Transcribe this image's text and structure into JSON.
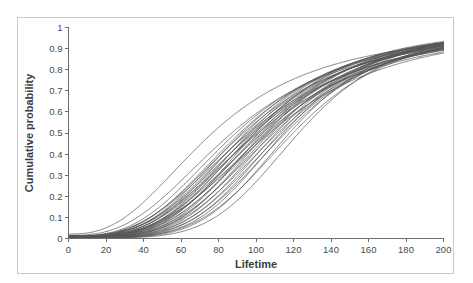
{
  "figure": {
    "background_color": "#ffffff",
    "frame_color": "#c8c8c8",
    "axis_color": "#6e6e6e",
    "curve_color": "#565656"
  },
  "chart_data": {
    "type": "line",
    "title": "",
    "subtitle": "",
    "xlabel": "Lifetime",
    "ylabel": "Cumulative probability",
    "xlim": [
      0,
      200
    ],
    "ylim": [
      0,
      1
    ],
    "grid": false,
    "legend": null,
    "legend_position": "none",
    "x_ticks": [
      0,
      20,
      40,
      60,
      80,
      100,
      120,
      140,
      160,
      180,
      200
    ],
    "x_tick_labels": [
      "0",
      "20",
      "40",
      "60",
      "80",
      "100",
      "120",
      "140",
      "160",
      "180",
      "200"
    ],
    "y_ticks": [
      0,
      0.1,
      0.2,
      0.3,
      0.4,
      0.5,
      0.6,
      0.7,
      0.8,
      0.9,
      1
    ],
    "y_tick_labels": [
      "0",
      "0.1",
      "0.2",
      "0.3",
      "0.4",
      "0.5",
      "0.6",
      "0.7",
      "0.8",
      "0.9",
      "1"
    ],
    "tick_direction": "out",
    "annotations": [],
    "x": [
      0,
      5,
      10,
      15,
      20,
      25,
      30,
      35,
      40,
      45,
      50,
      55,
      60,
      65,
      70,
      75,
      80,
      85,
      90,
      95,
      100,
      105,
      110,
      115,
      120,
      125,
      130,
      135,
      140,
      145,
      150,
      155,
      160,
      165,
      170,
      175,
      180,
      185,
      190,
      195,
      200
    ],
    "series": [
      {
        "name": "curve-01",
        "median": 78,
        "shape": 2.55,
        "start": 0.021
      },
      {
        "name": "curve-02",
        "median": 88,
        "shape": 2.7,
        "start": 0.015
      },
      {
        "name": "curve-03",
        "median": 90,
        "shape": 2.95,
        "start": 0.012
      },
      {
        "name": "curve-04",
        "median": 92,
        "shape": 3.1,
        "start": 0.01
      },
      {
        "name": "curve-05",
        "median": 93,
        "shape": 3.25,
        "start": 0.01
      },
      {
        "name": "curve-06",
        "median": 94,
        "shape": 3.0,
        "start": 0.011
      },
      {
        "name": "curve-07",
        "median": 95,
        "shape": 3.4,
        "start": 0.009
      },
      {
        "name": "curve-08",
        "median": 96,
        "shape": 3.15,
        "start": 0.01
      },
      {
        "name": "curve-09",
        "median": 97,
        "shape": 3.55,
        "start": 0.008
      },
      {
        "name": "curve-10",
        "median": 97,
        "shape": 2.9,
        "start": 0.012
      },
      {
        "name": "curve-11",
        "median": 98,
        "shape": 3.3,
        "start": 0.009
      },
      {
        "name": "curve-12",
        "median": 99,
        "shape": 3.6,
        "start": 0.008
      },
      {
        "name": "curve-13",
        "median": 99,
        "shape": 3.05,
        "start": 0.011
      },
      {
        "name": "curve-14",
        "median": 100,
        "shape": 3.45,
        "start": 0.009
      },
      {
        "name": "curve-15",
        "median": 100,
        "shape": 3.8,
        "start": 0.007
      },
      {
        "name": "curve-16",
        "median": 101,
        "shape": 3.2,
        "start": 0.01
      },
      {
        "name": "curve-17",
        "median": 102,
        "shape": 3.65,
        "start": 0.008
      },
      {
        "name": "curve-18",
        "median": 102,
        "shape": 3.0,
        "start": 0.011
      },
      {
        "name": "curve-19",
        "median": 103,
        "shape": 3.5,
        "start": 0.008
      },
      {
        "name": "curve-20",
        "median": 104,
        "shape": 3.9,
        "start": 0.006
      },
      {
        "name": "curve-21",
        "median": 104,
        "shape": 3.25,
        "start": 0.009
      },
      {
        "name": "curve-22",
        "median": 105,
        "shape": 3.7,
        "start": 0.007
      },
      {
        "name": "curve-23",
        "median": 106,
        "shape": 3.35,
        "start": 0.009
      },
      {
        "name": "curve-24",
        "median": 106,
        "shape": 4.05,
        "start": 0.006
      },
      {
        "name": "curve-25",
        "median": 107,
        "shape": 3.55,
        "start": 0.008
      },
      {
        "name": "curve-26",
        "median": 108,
        "shape": 3.85,
        "start": 0.006
      },
      {
        "name": "curve-27",
        "median": 108,
        "shape": 3.2,
        "start": 0.01
      },
      {
        "name": "curve-28",
        "median": 109,
        "shape": 4.1,
        "start": 0.005
      },
      {
        "name": "curve-29",
        "median": 110,
        "shape": 3.65,
        "start": 0.007
      },
      {
        "name": "curve-30",
        "median": 111,
        "shape": 4.25,
        "start": 0.005
      },
      {
        "name": "curve-31",
        "median": 112,
        "shape": 3.8,
        "start": 0.006
      },
      {
        "name": "curve-32",
        "median": 113,
        "shape": 4.4,
        "start": 0.004
      },
      {
        "name": "curve-33",
        "median": 114,
        "shape": 4.0,
        "start": 0.005
      },
      {
        "name": "curve-34",
        "median": 115,
        "shape": 4.55,
        "start": 0.004
      },
      {
        "name": "curve-35",
        "median": 116,
        "shape": 4.2,
        "start": 0.005
      },
      {
        "name": "curve-36",
        "median": 118,
        "shape": 4.7,
        "start": 0.003
      },
      {
        "name": "curve-37",
        "median": 120,
        "shape": 4.4,
        "start": 0.004
      },
      {
        "name": "curve-38",
        "median": 123,
        "shape": 4.9,
        "start": 0.003
      }
    ]
  }
}
